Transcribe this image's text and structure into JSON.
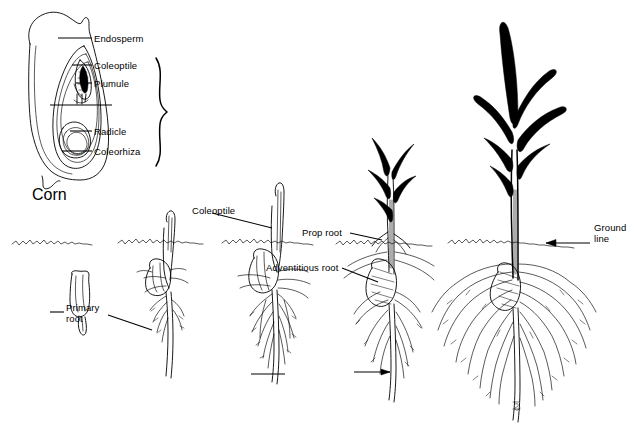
{
  "figure": {
    "title": "Corn",
    "ink_color": "#000000",
    "background_color": "#ffffff"
  },
  "seed_diagram": {
    "name": "corn-kernel-longitudinal-section",
    "labels": [
      {
        "id": "endosperm",
        "text": "Endosperm",
        "x": 94,
        "y": 33,
        "leader_from_x": 58,
        "leader_to_x": 92,
        "leader_y": 38
      },
      {
        "id": "coleoptile",
        "text": "Coleoptile",
        "x": 94,
        "y": 60,
        "leader_from_x": 72,
        "leader_to_x": 92,
        "leader_y": 65
      },
      {
        "id": "plumule",
        "text": "Plumule",
        "x": 94,
        "y": 78,
        "leader_from_x": 76,
        "leader_to_x": 92,
        "leader_y": 83
      },
      {
        "id": "scutellum-unlabeled",
        "text": "",
        "x": 0,
        "y": 0,
        "leader_from_x": 50,
        "leader_to_x": 112,
        "leader_y": 105
      },
      {
        "id": "radicle",
        "text": "Radicle",
        "x": 94,
        "y": 126,
        "leader_from_x": 70,
        "leader_to_x": 92,
        "leader_y": 131
      },
      {
        "id": "coleorhiza",
        "text": "Coleorhiza",
        "x": 94,
        "y": 146,
        "leader_from_x": 62,
        "leader_to_x": 92,
        "leader_y": 151
      }
    ],
    "brace": {
      "name": "embryo-brace",
      "x": 160,
      "y_top": 58,
      "y_bottom": 166
    }
  },
  "germination_stages": [
    {
      "id": "stage-1-dormant-seed",
      "center_x": 82,
      "ground_y": 243
    },
    {
      "id": "stage-2-coleoptile-emerging",
      "center_x": 168,
      "ground_y": 243
    },
    {
      "id": "stage-3-seedling",
      "center_x": 278,
      "ground_y": 243
    },
    {
      "id": "stage-4-leafy-seedling",
      "center_x": 392,
      "ground_y": 243
    },
    {
      "id": "stage-5-young-plant",
      "center_x": 512,
      "ground_y": 243
    }
  ],
  "stage_labels": [
    {
      "id": "primary-root",
      "text": "Primary\nroot",
      "line1": "Primary",
      "line2": "root",
      "x": 66,
      "y": 307
    },
    {
      "id": "coleoptile-stage",
      "text": "Coleoptile",
      "line1": "Coleoptile",
      "line2": "",
      "x": 192,
      "y": 205
    },
    {
      "id": "prop-root",
      "text": "Prop root",
      "line1": "Prop root",
      "line2": "",
      "x": 302,
      "y": 227
    },
    {
      "id": "adventitious-root",
      "text": "Adventitious root",
      "line1": "Adventitious root",
      "line2": "",
      "x": 266,
      "y": 262
    },
    {
      "id": "ground-line",
      "text": "Ground\nline",
      "line1": "Ground",
      "line2": "line",
      "x": 594,
      "y": 227
    }
  ],
  "signature": {
    "id": "artist-signature",
    "text": "",
    "x": 516,
    "y": 406
  }
}
